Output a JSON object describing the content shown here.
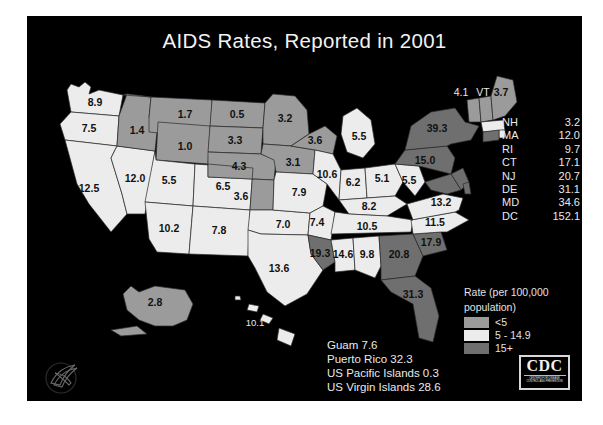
{
  "slide": {
    "title": "AIDS Rates, Reported in 2001",
    "background_color": "#000000",
    "text_color": "#f2f2f2"
  },
  "legend": {
    "title_line1": "Rate (per 100,000",
    "title_line2": "population)",
    "items": [
      {
        "label": "<5",
        "color": "#9b9b9b"
      },
      {
        "label": "5 - 14.9",
        "color": "#ececec"
      },
      {
        "label": "15+",
        "color": "#6f6f6f"
      }
    ]
  },
  "northeast_list": [
    {
      "abbr": "NH",
      "value": "3.2"
    },
    {
      "abbr": "MA",
      "value": "12.0"
    },
    {
      "abbr": "RI",
      "value": "9.7"
    },
    {
      "abbr": "CT",
      "value": "17.1"
    },
    {
      "abbr": "NJ",
      "value": "20.7"
    },
    {
      "abbr": "DE",
      "value": "31.1"
    },
    {
      "abbr": "MD",
      "value": "34.6"
    },
    {
      "abbr": "DC",
      "value": "152.1"
    }
  ],
  "territories": [
    "Guam 7.6",
    "Puerto Rico  32.3",
    "US Pacific Islands 0.3",
    "US Virgin Islands  28.6"
  ],
  "callouts": {
    "vt_rate": "4.1",
    "vt_abbr": "VT"
  },
  "logos": {
    "cdc_text": "CDC",
    "cdc_subtext": "CENTERS FOR DISEASE CONTROL AND PREVENTION"
  },
  "chart_data": {
    "type": "map",
    "title": "AIDS Rates, Reported in 2001",
    "units": "cases per 100,000 population",
    "legend_bins": [
      "<5",
      "5 - 14.9",
      "15+"
    ],
    "bin_colors": [
      "#9b9b9b",
      "#ececec",
      "#6f6f6f"
    ],
    "states": [
      {
        "abbr": "WA",
        "value": 8.9,
        "bin": "5 - 14.9"
      },
      {
        "abbr": "OR",
        "value": 7.5,
        "bin": "5 - 14.9"
      },
      {
        "abbr": "CA",
        "value": 12.5,
        "bin": "5 - 14.9"
      },
      {
        "abbr": "NV",
        "value": 12.0,
        "bin": "5 - 14.9"
      },
      {
        "abbr": "ID",
        "value": 1.4,
        "bin": "<5"
      },
      {
        "abbr": "MT",
        "value": 1.7,
        "bin": "<5"
      },
      {
        "abbr": "WY",
        "value": 1.0,
        "bin": "<5"
      },
      {
        "abbr": "UT",
        "value": 5.5,
        "bin": "5 - 14.9"
      },
      {
        "abbr": "AZ",
        "value": 10.2,
        "bin": "5 - 14.9"
      },
      {
        "abbr": "CO",
        "value": 6.5,
        "bin": "5 - 14.9"
      },
      {
        "abbr": "NM",
        "value": 7.8,
        "bin": "5 - 14.9"
      },
      {
        "abbr": "ND",
        "value": 0.5,
        "bin": "<5"
      },
      {
        "abbr": "SD",
        "value": 3.3,
        "bin": "<5"
      },
      {
        "abbr": "NE",
        "value": 4.3,
        "bin": "<5"
      },
      {
        "abbr": "KS",
        "value": 3.6,
        "bin": "<5"
      },
      {
        "abbr": "OK",
        "value": 7.0,
        "bin": "5 - 14.9"
      },
      {
        "abbr": "TX",
        "value": 13.6,
        "bin": "5 - 14.9"
      },
      {
        "abbr": "MN",
        "value": 3.2,
        "bin": "<5"
      },
      {
        "abbr": "IA",
        "value": 3.1,
        "bin": "<5"
      },
      {
        "abbr": "MO",
        "value": 7.9,
        "bin": "5 - 14.9"
      },
      {
        "abbr": "AR",
        "value": 7.4,
        "bin": "5 - 14.9"
      },
      {
        "abbr": "LA",
        "value": 19.3,
        "bin": "15+"
      },
      {
        "abbr": "WI",
        "value": 3.6,
        "bin": "<5"
      },
      {
        "abbr": "IL",
        "value": 10.6,
        "bin": "5 - 14.9"
      },
      {
        "abbr": "MI",
        "value": 5.5,
        "bin": "5 - 14.9"
      },
      {
        "abbr": "IN",
        "value": 6.2,
        "bin": "5 - 14.9"
      },
      {
        "abbr": "OH",
        "value": 5.1,
        "bin": "5 - 14.9"
      },
      {
        "abbr": "KY",
        "value": 8.2,
        "bin": "5 - 14.9"
      },
      {
        "abbr": "TN",
        "value": 10.5,
        "bin": "5 - 14.9"
      },
      {
        "abbr": "MS",
        "value": 14.6,
        "bin": "5 - 14.9"
      },
      {
        "abbr": "AL",
        "value": 9.8,
        "bin": "5 - 14.9"
      },
      {
        "abbr": "GA",
        "value": 20.8,
        "bin": "15+"
      },
      {
        "abbr": "FL",
        "value": 31.3,
        "bin": "15+"
      },
      {
        "abbr": "SC",
        "value": 17.9,
        "bin": "15+"
      },
      {
        "abbr": "NC",
        "value": 11.5,
        "bin": "5 - 14.9"
      },
      {
        "abbr": "VA",
        "value": 13.2,
        "bin": "5 - 14.9"
      },
      {
        "abbr": "WV",
        "value": 5.5,
        "bin": "5 - 14.9"
      },
      {
        "abbr": "PA",
        "value": 15.0,
        "bin": "15+"
      },
      {
        "abbr": "NY",
        "value": 39.3,
        "bin": "15+"
      },
      {
        "abbr": "VT",
        "value": 4.1,
        "bin": "<5"
      },
      {
        "abbr": "ME",
        "value": 3.7,
        "bin": "<5"
      },
      {
        "abbr": "NH",
        "value": 3.2,
        "bin": "<5"
      },
      {
        "abbr": "MA",
        "value": 12.0,
        "bin": "5 - 14.9"
      },
      {
        "abbr": "RI",
        "value": 9.7,
        "bin": "5 - 14.9"
      },
      {
        "abbr": "CT",
        "value": 17.1,
        "bin": "15+"
      },
      {
        "abbr": "NJ",
        "value": 20.7,
        "bin": "15+"
      },
      {
        "abbr": "DE",
        "value": 31.1,
        "bin": "15+"
      },
      {
        "abbr": "MD",
        "value": 34.6,
        "bin": "15+"
      },
      {
        "abbr": "DC",
        "value": 152.1,
        "bin": "15+"
      },
      {
        "abbr": "AK",
        "value": 2.8,
        "bin": "<5"
      },
      {
        "abbr": "HI",
        "value": 10.1,
        "bin": "5 - 14.9"
      }
    ],
    "territories": [
      {
        "name": "Guam",
        "value": 7.6
      },
      {
        "name": "Puerto Rico",
        "value": 32.3
      },
      {
        "name": "US Pacific Islands",
        "value": 0.3
      },
      {
        "name": "US Virgin Islands",
        "value": 28.6
      }
    ]
  },
  "map_labels": {
    "WA": "8.9",
    "OR": "7.5",
    "CA": "12.5",
    "NV": "12.0",
    "ID": "1.4",
    "MT": "1.7",
    "WY": "1.0",
    "UT": "5.5",
    "AZ": "10.2",
    "CO": "6.5",
    "NM": "7.8",
    "ND": "0.5",
    "SD": "3.3",
    "NE": "4.3",
    "KS": "3.6",
    "OK": "7.0",
    "TX": "13.6",
    "MN": "3.2",
    "IA": "3.1",
    "MO": "7.9",
    "AR": "7.4",
    "LA": "19.3",
    "WI": "3.6",
    "IL": "10.6",
    "MI": "5.5",
    "IN": "6.2",
    "OH": "5.1",
    "KY": "8.2",
    "TN": "10.5",
    "MS": "14.6",
    "AL": "9.8",
    "GA": "20.8",
    "FL": "31.3",
    "SC": "17.9",
    "NC": "11.5",
    "VA": "13.2",
    "WV": "5.5",
    "PA": "15.0",
    "NY": "39.3",
    "ME": "3.7",
    "AK": "2.8",
    "HI": "10.1"
  }
}
